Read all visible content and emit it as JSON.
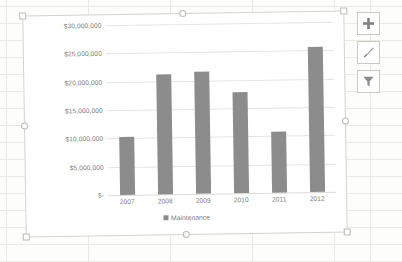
{
  "chart_data": {
    "type": "bar",
    "title": "",
    "xlabel": "",
    "ylabel": "",
    "categories": [
      "2007",
      "2008",
      "2009",
      "2010",
      "2011",
      "2012"
    ],
    "series": [
      {
        "name": "Maintenance",
        "values": [
          10200000,
          21100000,
          21600000,
          17900000,
          10800000,
          25600000
        ],
        "color": "#8c8c8c"
      }
    ],
    "ylim": [
      0,
      30000000
    ],
    "ytick_values": [
      0,
      5000000,
      10000000,
      15000000,
      20000000,
      25000000,
      30000000
    ],
    "ytick_labels": [
      "$-",
      "$5,000,000",
      "$10,000,000",
      "$15,000,000",
      "$20,000,000",
      "$25,000,000",
      "$30,000,000"
    ],
    "grid": true,
    "legend_position": "bottom",
    "legend_entries": [
      "Maintenance"
    ]
  },
  "legend": {
    "series_label": "Maintenance"
  },
  "chart_buttons": [
    {
      "name": "chart-elements",
      "icon": "plus-icon",
      "tooltip": "Chart Elements"
    },
    {
      "name": "chart-styles",
      "icon": "paintbrush-icon",
      "tooltip": "Chart Styles"
    },
    {
      "name": "chart-filters",
      "icon": "funnel-icon",
      "tooltip": "Chart Filters"
    }
  ],
  "selection": {
    "handles": [
      "top-left",
      "top-center",
      "top-right",
      "left-center",
      "right-center",
      "bottom-left",
      "bottom-center",
      "bottom-right"
    ]
  }
}
